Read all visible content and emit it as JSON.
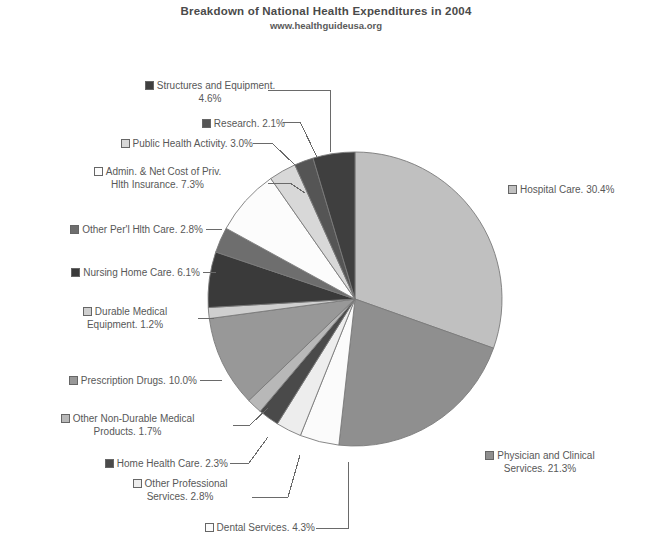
{
  "chart_data": {
    "type": "pie",
    "title": "Breakdown of National Health Expenditures in 2004",
    "subtitle": "www.healthguideusa.org",
    "xlabel": "",
    "ylabel": "",
    "legend_position": "callout-labels",
    "grid": false,
    "units": "percent",
    "categories": [
      "Hospital Care",
      "Physician and Clinical Services",
      "Dental Services",
      "Other Professional Services",
      "Home Health Care",
      "Other Non-Durable Medical Products",
      "Prescription Drugs",
      "Durable Medical Equipment",
      "Nursing Home Care",
      "Other Per'l Hlth Care",
      "Admin. & Net Cost of Priv. Hlth Insurance",
      "Public Health Activity",
      "Research",
      "Structures and Equipment"
    ],
    "values": [
      30.4,
      21.3,
      4.3,
      2.8,
      2.3,
      1.7,
      10.0,
      1.2,
      6.1,
      2.8,
      7.3,
      3.0,
      2.1,
      4.6
    ],
    "colors": [
      "#c0c0c0",
      "#8f8f8f",
      "#fbfbfb",
      "#ededed",
      "#4a4a4a",
      "#b8b8b8",
      "#989898",
      "#cfcfcf",
      "#3a3a3a",
      "#6e6e6e",
      "#fcfcfc",
      "#d8d8d8",
      "#555555",
      "#3f3f3f"
    ]
  },
  "labels": [
    {
      "id": "structures-and-equipment",
      "line1": "Structures and Equipment.",
      "line2": "4.6%",
      "marker": "#3f3f3f"
    },
    {
      "id": "research",
      "line1": "Research. 2.1%",
      "line2": "",
      "marker": "#555555"
    },
    {
      "id": "public-health-activity",
      "line1": "Public Health Activity. 3.0%",
      "line2": "",
      "marker": "#d8d8d8"
    },
    {
      "id": "admin-net-cost-private-health-insurance",
      "line1": "Admin. & Net Cost of Priv.",
      "line2": "Hlth Insurance. 7.3%",
      "marker": "#fcfcfc"
    },
    {
      "id": "other-personal-health-care",
      "line1": "Other Per'l Hlth Care. 2.8%",
      "line2": "",
      "marker": "#6e6e6e"
    },
    {
      "id": "nursing-home-care",
      "line1": "Nursing Home Care. 6.1%",
      "line2": "",
      "marker": "#3a3a3a"
    },
    {
      "id": "durable-medical-equipment",
      "line1": "Durable Medical",
      "line2": "Equipment. 1.2%",
      "marker": "#cfcfcf"
    },
    {
      "id": "prescription-drugs",
      "line1": "Prescription Drugs. 10.0%",
      "line2": "",
      "marker": "#989898"
    },
    {
      "id": "other-non-durable-medical-products",
      "line1": "Other Non-Durable Medical",
      "line2": "Products. 1.7%",
      "marker": "#b8b8b8"
    },
    {
      "id": "home-health-care",
      "line1": "Home Health Care. 2.3%",
      "line2": "",
      "marker": "#4a4a4a"
    },
    {
      "id": "other-professional-services",
      "line1": "Other Professional",
      "line2": "Services. 2.8%",
      "marker": "#ededed"
    },
    {
      "id": "dental-services",
      "line1": "Dental Services. 4.3%",
      "line2": "",
      "marker": "#fbfbfb"
    },
    {
      "id": "hospital-care",
      "line1": "Hospital Care. 30.4%",
      "line2": "",
      "marker": "#c0c0c0"
    },
    {
      "id": "physician-and-clinical-services",
      "line1": "Physician and Clinical",
      "line2": "Services. 21.3%",
      "marker": "#8f8f8f"
    }
  ]
}
